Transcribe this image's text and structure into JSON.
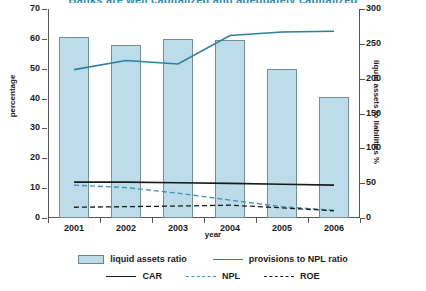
{
  "title": "Banks are well capitalized and adequately capitalized",
  "axes": {
    "y_left_label": "percentage",
    "y_right_label": "liquid assets to liabilities %",
    "x_label": "year",
    "y_left_ticks": [
      "0",
      "10",
      "20",
      "30",
      "40",
      "50",
      "60",
      "70"
    ],
    "y_right_ticks": [
      "0",
      "50",
      "100",
      "150",
      "200",
      "250",
      "300"
    ],
    "x_ticks": [
      "2001",
      "2002",
      "2003",
      "2004",
      "2005",
      "2006"
    ]
  },
  "legend": {
    "row1": [
      {
        "label": "liquid assets ratio",
        "marker": "box",
        "color": "#bcdcea"
      },
      {
        "label": "provisions to NPL ratio",
        "marker": "line",
        "color": "#2e7f9e"
      }
    ],
    "row2": [
      {
        "label": "CAR",
        "marker": "line",
        "color": "#1a1a1a"
      },
      {
        "label": "NPL",
        "marker": "dash",
        "color": "#3b93b4"
      },
      {
        "label": "ROE",
        "marker": "dash",
        "color": "#1a1a1a"
      }
    ]
  },
  "colors": {
    "bar_fill": "#bcdcea",
    "bar_stroke": "#7a8c93",
    "blue_line": "#2e7f9e",
    "blue_dash": "#3b93b4",
    "black_line": "#1a1a1a",
    "title": "#2e8aa8"
  },
  "chart_data": {
    "type": "bar",
    "title": "Banks are well capitalized and adequately capitalized",
    "xlabel": "year",
    "ylabel": "percentage",
    "y2label": "liquid assets to liabilities %",
    "categories": [
      "2001",
      "2002",
      "2003",
      "2004",
      "2005",
      "2006"
    ],
    "ylim": [
      0,
      70
    ],
    "y2lim": [
      0,
      300
    ],
    "ytick_step": 10,
    "y2tick_step": 50,
    "grid": false,
    "legend_position": "bottom",
    "series": [
      {
        "name": "liquid assets ratio",
        "type": "bar",
        "axis": "left",
        "color": "#bcdcea",
        "values": [
          60.5,
          58.0,
          60.0,
          59.5,
          50.0,
          40.5
        ]
      },
      {
        "name": "provisions to NPL ratio",
        "type": "line",
        "axis": "right",
        "style": "solid",
        "color": "#2e7f9e",
        "values": [
          213,
          226,
          221,
          262,
          267,
          268
        ]
      },
      {
        "name": "CAR",
        "type": "line",
        "axis": "left",
        "style": "solid",
        "color": "#1a1a1a",
        "values": [
          12.0,
          12.0,
          11.8,
          11.6,
          11.3,
          11.0
        ]
      },
      {
        "name": "NPL",
        "type": "line",
        "axis": "left",
        "style": "dashed",
        "color": "#3b93b4",
        "values": [
          11.0,
          10.2,
          8.3,
          6.0,
          3.8,
          2.6
        ]
      },
      {
        "name": "ROE",
        "type": "line",
        "axis": "left",
        "style": "dashed",
        "color": "#1a1a1a",
        "values": [
          3.6,
          3.8,
          4.0,
          4.3,
          3.4,
          2.4
        ]
      }
    ]
  }
}
